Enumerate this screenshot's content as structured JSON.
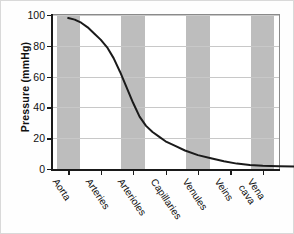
{
  "chart_data": {
    "type": "line",
    "title": "",
    "xlabel": "",
    "ylabel": "Pressure (mmHg)",
    "ylim": [
      0,
      100
    ],
    "yticks": [
      0,
      20,
      40,
      60,
      80,
      100
    ],
    "ytick_labels": [
      "0",
      "20",
      "40",
      "60",
      "80",
      "100"
    ],
    "grid": "horizontal",
    "legend": "none",
    "categories": [
      "Aorta",
      "Arteries",
      "Arterioles",
      "Capillaries",
      "Venules",
      "Veins",
      "Vena cava"
    ],
    "category_label_lines": [
      [
        "Aorta"
      ],
      [
        "Arteries"
      ],
      [
        "Arterioles"
      ],
      [
        "Capillaries"
      ],
      [
        "Venules"
      ],
      [
        "Veins"
      ],
      [
        "Vena",
        "cava"
      ]
    ],
    "shaded_categories": [
      "Aorta",
      "Arterioles",
      "Venules",
      "Vena cava"
    ],
    "band_color": "#bdbdbd",
    "curve_color": "#1a1a1a",
    "series": [
      {
        "name": "Blood pressure",
        "values": [
          98,
          93,
          40,
          20,
          11,
          5,
          2
        ],
        "points": [
          {
            "x": 0.0,
            "y": 98
          },
          {
            "x": 0.2,
            "y": 97
          },
          {
            "x": 0.4,
            "y": 95
          },
          {
            "x": 0.6,
            "y": 92
          },
          {
            "x": 0.8,
            "y": 88
          },
          {
            "x": 1.0,
            "y": 84
          },
          {
            "x": 1.2,
            "y": 79
          },
          {
            "x": 1.4,
            "y": 72
          },
          {
            "x": 1.6,
            "y": 63
          },
          {
            "x": 1.8,
            "y": 53
          },
          {
            "x": 2.0,
            "y": 43
          },
          {
            "x": 2.2,
            "y": 34
          },
          {
            "x": 2.4,
            "y": 28
          },
          {
            "x": 2.6,
            "y": 24
          },
          {
            "x": 2.8,
            "y": 21
          },
          {
            "x": 3.0,
            "y": 18
          },
          {
            "x": 3.3,
            "y": 15
          },
          {
            "x": 3.6,
            "y": 12
          },
          {
            "x": 4.0,
            "y": 9
          },
          {
            "x": 4.4,
            "y": 7
          },
          {
            "x": 4.8,
            "y": 5
          },
          {
            "x": 5.2,
            "y": 3.5
          },
          {
            "x": 5.6,
            "y": 2.6
          },
          {
            "x": 6.0,
            "y": 2.1
          },
          {
            "x": 6.5,
            "y": 1.8
          },
          {
            "x": 7.0,
            "y": 1.6
          }
        ]
      }
    ]
  }
}
